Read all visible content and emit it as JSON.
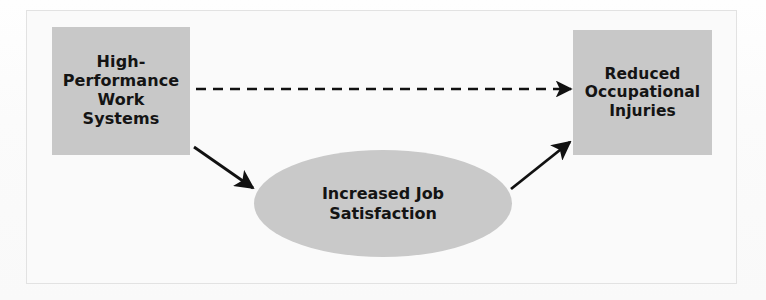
{
  "figure": {
    "type": "mediation-model-diagram",
    "background_color": "#fafafa",
    "frame_border_color": "#e2e2e2",
    "node_fill_color": "#c8c8c8",
    "node_shadow_color": "#d6d6d6",
    "text_color": "#141414",
    "connector_color": "#111111"
  },
  "nodes": {
    "antecedent": {
      "id": "high-performance-work-systems",
      "label": "High-\nPerformance\nWork\nSystems",
      "shape": "rectangle"
    },
    "mediator": {
      "id": "increased-job-satisfaction",
      "label": "Increased Job\nSatisfaction",
      "shape": "ellipse"
    },
    "outcome": {
      "id": "reduced-occupational-injuries",
      "label": "Reduced\nOccupational\nInjuries",
      "shape": "rectangle"
    }
  },
  "connectors": [
    {
      "id": "direct-path",
      "from": "high-performance-work-systems",
      "to": "reduced-occupational-injuries",
      "style": "dashed",
      "arrowhead": "single",
      "orientation": "horizontal"
    },
    {
      "id": "path-a",
      "from": "high-performance-work-systems",
      "to": "increased-job-satisfaction",
      "style": "solid",
      "arrowhead": "single",
      "orientation": "diagonal-down-right"
    },
    {
      "id": "path-b",
      "from": "increased-job-satisfaction",
      "to": "reduced-occupational-injuries",
      "style": "solid",
      "arrowhead": "single",
      "orientation": "diagonal-up-right"
    }
  ]
}
